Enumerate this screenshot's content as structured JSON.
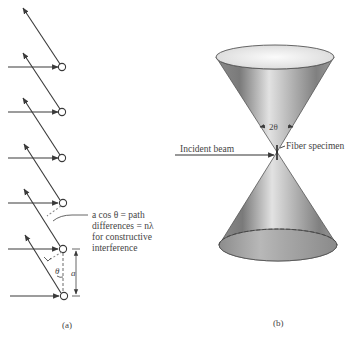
{
  "panel_a": {
    "caption": "(a)",
    "annotation_lines": [
      "a cos θ = path",
      "differences = nλ",
      "for constructive",
      "interference"
    ],
    "theta_label": "θ",
    "spacing_label": "a",
    "atom_count": 6
  },
  "panel_b": {
    "caption": "(b)",
    "incident_label": "Incident beam",
    "specimen_label": "Fiber specimen",
    "angle_label": "2θ"
  },
  "colors": {
    "line": "#3a3a3a",
    "text": "#444444",
    "cone_dark": "#6e6e6e",
    "cone_light": "#f2f2f2"
  }
}
